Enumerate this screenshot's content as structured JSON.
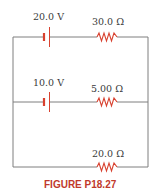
{
  "figure": {
    "caption_prefix": "Figure",
    "caption_number": "P18.27",
    "caption": "FIGURE P18.27"
  },
  "circuit": {
    "branches": [
      {
        "position": "top",
        "battery": {
          "label": "20.0 V",
          "value_volts": 20.0
        },
        "resistor": {
          "label": "30.0 Ω",
          "value_ohms": 30.0
        }
      },
      {
        "position": "middle",
        "battery": {
          "label": "10.0 V",
          "value_volts": 10.0
        },
        "resistor": {
          "label": "5.00 Ω",
          "value_ohms": 5.0
        }
      },
      {
        "position": "bottom",
        "battery": null,
        "resistor": {
          "label": "20.0 Ω",
          "value_ohms": 20.0
        }
      }
    ]
  },
  "colors": {
    "wire": "#7f7f7f",
    "component": "#d8412f",
    "caption": "#c0392b",
    "label": "#3a3a3a"
  }
}
